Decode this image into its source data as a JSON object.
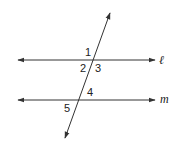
{
  "diagram": {
    "type": "parallel lines cut by transversal",
    "lines": [
      {
        "name": "l",
        "label": "ℓ"
      },
      {
        "name": "m",
        "label": "m"
      }
    ],
    "angle_labels": [
      "1",
      "2",
      "3",
      "4",
      "5"
    ],
    "stroke_color": "#333333"
  }
}
